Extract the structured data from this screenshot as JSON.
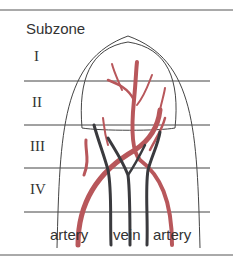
{
  "title": "Subzone",
  "subzones": [
    {
      "label": "I"
    },
    {
      "label": "II"
    },
    {
      "label": "III"
    },
    {
      "label": "IV"
    }
  ],
  "vessel_labels": {
    "left": "artery",
    "center": "vein",
    "right": "artery"
  },
  "colors": {
    "artery": "#b8575b",
    "vein": "#3a3a3e",
    "line": "#444444"
  }
}
